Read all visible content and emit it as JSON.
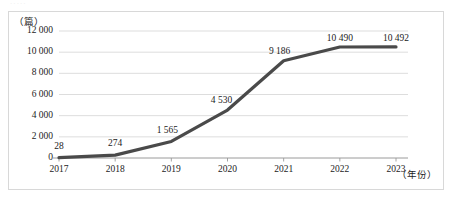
{
  "figure": {
    "top_sliver_text": "·····",
    "y_unit_label": "（篇）",
    "x_unit_label": "（年份）"
  },
  "chart_data": {
    "type": "line",
    "title": "",
    "subtitle": "",
    "xlabel": "（年份）",
    "ylabel": "（篇）",
    "categories": [
      "2017",
      "2018",
      "2019",
      "2020",
      "2021",
      "2022",
      "2023"
    ],
    "values": [
      28,
      274,
      1565,
      4530,
      9186,
      10490,
      10492
    ],
    "point_labels": [
      "28",
      "274",
      "1 565",
      "4 530",
      "9 186",
      "10 490",
      "10 492"
    ],
    "ylim": [
      0,
      12000
    ],
    "ytick_values": [
      0,
      2000,
      4000,
      6000,
      8000,
      10000,
      12000
    ],
    "ytick_labels": [
      "0",
      "2 000",
      "4 000",
      "6 000",
      "8 000",
      "10 000",
      "12 000"
    ],
    "xtick_labels": [
      "2017",
      "2018",
      "2019",
      "2020",
      "2021",
      "2022",
      "2023"
    ],
    "grid": true,
    "grid_axis": "y",
    "legend": false,
    "legend_position": "none",
    "series": [
      {
        "name": "发文量",
        "color": "#4a4a4a",
        "values": [
          28,
          274,
          1565,
          4530,
          9186,
          10490,
          10492
        ]
      }
    ],
    "colors": {
      "line": "#4a4a4a",
      "grid": "#d9d9d9",
      "axis": "#9a9a9a",
      "text": "#1c1c1c",
      "frame": "#d8d8d8",
      "background": "#ffffff"
    }
  }
}
